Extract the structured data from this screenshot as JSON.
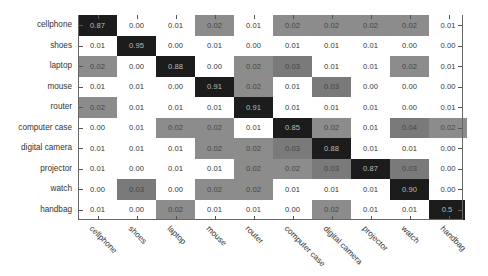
{
  "chart_data": {
    "type": "heatmap",
    "title": "",
    "xlabel": "",
    "ylabel": "",
    "rows": [
      "cellphone",
      "shoes",
      "laptop",
      "mouse",
      "router",
      "computer case",
      "digital camera",
      "projector",
      "watch",
      "handbag"
    ],
    "columns": [
      "cellphone",
      "shoes",
      "laptop",
      "mouse",
      "router",
      "computer case",
      "digital camera",
      "projector",
      "watch",
      "handbag"
    ],
    "values": [
      [
        0.87,
        0.0,
        0.01,
        0.02,
        0.01,
        0.02,
        0.02,
        0.02,
        0.02,
        0.01
      ],
      [
        0.01,
        0.95,
        0.0,
        0.01,
        0.0,
        0.01,
        0.01,
        0.01,
        0.0,
        0.0
      ],
      [
        0.02,
        0.0,
        0.88,
        0.0,
        0.02,
        0.03,
        0.01,
        0.01,
        0.02,
        0.01
      ],
      [
        0.01,
        0.01,
        0.0,
        0.91,
        0.02,
        0.01,
        0.03,
        0.0,
        0.0,
        0.0
      ],
      [
        0.02,
        0.01,
        0.01,
        0.01,
        0.91,
        0.01,
        0.01,
        0.01,
        0.0,
        0.01
      ],
      [
        0.0,
        0.01,
        0.02,
        0.02,
        0.01,
        0.85,
        0.02,
        0.01,
        0.04,
        0.02
      ],
      [
        0.01,
        0.01,
        0.01,
        0.02,
        0.02,
        0.03,
        0.88,
        0.01,
        0.01,
        0.0
      ],
      [
        0.01,
        0.0,
        0.01,
        0.01,
        0.02,
        0.02,
        0.03,
        0.87,
        0.03,
        0.0
      ],
      [
        0.0,
        0.03,
        0.0,
        0.02,
        0.02,
        0.01,
        0.01,
        0.01,
        0.9,
        0.0
      ],
      [
        0.01,
        0.0,
        0.02,
        0.01,
        0.01,
        0.0,
        0.02,
        0.01,
        0.01,
        0.59
      ]
    ],
    "display_labels": [
      [
        "0.87",
        "0.00",
        "0.01",
        "0.02",
        "0.01",
        "0.02",
        "0.02",
        "0.02",
        "0.02",
        "0.01"
      ],
      [
        "0.01",
        "0.95",
        "0.00",
        "0.01",
        "0.00",
        "0.01",
        "0.01",
        "0.01",
        "0.00",
        "0.00"
      ],
      [
        "0.02",
        "0.00",
        "0.88",
        "0.00",
        "0.02",
        "0.03",
        "0.01",
        "0.01",
        "0.02",
        "0.01"
      ],
      [
        "0.01",
        "0.01",
        "0.00",
        "0.91",
        "0.02",
        "0.01",
        "0.03",
        "0.00",
        "0.00",
        "0.00"
      ],
      [
        "0.02",
        "0.01",
        "0.01",
        "0.01",
        "0.91",
        "0.01",
        "0.01",
        "0.01",
        "0.00",
        "0.01"
      ],
      [
        "0.00",
        "0.01",
        "0.02",
        "0.02",
        "0.01",
        "0.85",
        "0.02",
        "0.01",
        "0.04",
        "0.02"
      ],
      [
        "0.01",
        "0.01",
        "0.01",
        "0.02",
        "0.02",
        "0.03",
        "0.88",
        "0.01",
        "0.01",
        "0.00"
      ],
      [
        "0.01",
        "0.00",
        "0.01",
        "0.01",
        "0.02",
        "0.02",
        "0.03",
        "0.87",
        "0.03",
        "0.00"
      ],
      [
        "0.00",
        "0.03",
        "0.00",
        "0.02",
        "0.02",
        "0.01",
        "0.01",
        "0.01",
        "0.90",
        "0.00"
      ],
      [
        "0.01",
        "0.00",
        "0.02",
        "0.01",
        "0.01",
        "0.00",
        "0.02",
        "0.01",
        "0.01",
        "0.5"
      ]
    ],
    "colormap": {
      "white_threshold_max": 0.01,
      "mid_gray": "#8c8c8c",
      "dark_gray": "#7a7a7a",
      "high": "#1c1c1c",
      "low": "#ffffff"
    },
    "grid": false,
    "legend": "none"
  }
}
